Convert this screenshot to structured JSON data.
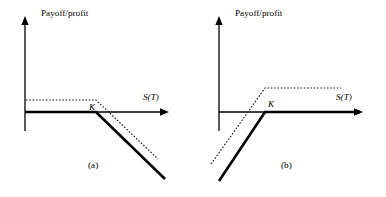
{
  "figure": {
    "width": 386,
    "height": 197,
    "background": "#ffffff",
    "line_color": "#000000"
  },
  "panels": [
    {
      "id": "a",
      "caption": "(a)",
      "caption_pos": {
        "x": 88,
        "y": 168
      },
      "y_axis_label": "Payoff/profit",
      "y_axis_label_pos": {
        "x": 41,
        "y": 16
      },
      "x_axis_label": "S(T)",
      "x_axis_label_pos": {
        "x": 143,
        "y": 100
      },
      "strike_label": "K",
      "strike_label_pos": {
        "x": 89,
        "y": 110
      },
      "axes": {
        "origin": {
          "x": 25,
          "y": 112
        },
        "y_top": 18,
        "y_bottom": 131,
        "x_right": 168
      },
      "strike_x": 96,
      "premium_y": 100
    },
    {
      "id": "b",
      "caption": "(b)",
      "caption_pos": {
        "x": 281,
        "y": 168
      },
      "y_axis_label": "Payoff/profit",
      "y_axis_label_pos": {
        "x": 235,
        "y": 16
      },
      "x_axis_label": "S(T)",
      "x_axis_label_pos": {
        "x": 336,
        "y": 100
      },
      "strike_label": "K",
      "strike_label_pos": {
        "x": 268,
        "y": 107
      },
      "axes": {
        "origin": {
          "x": 219,
          "y": 112
        },
        "y_top": 18,
        "y_bottom": 131,
        "x_right": 362
      },
      "strike_x": 265,
      "premium_y": 88
    }
  ],
  "chart_data": {
    "type": "line",
    "title": "",
    "subtitle": "",
    "xlabel": "S(T)",
    "ylabel": "Payoff/profit",
    "grid": false,
    "legend": "none",
    "annotations": [
      "K",
      "(a)",
      "(b)"
    ],
    "charts": [
      {
        "panel": "a",
        "description": "Short call position: payoff (solid) and profit (dotted) versus terminal stock price",
        "xlabel": "S(T)",
        "ylabel": "Payoff/profit",
        "x_axis_at_y": 0,
        "strike": "K",
        "series": [
          {
            "name": "payoff",
            "style": "solid",
            "points": [
              {
                "x": 25,
                "y": 112
              },
              {
                "x": 96,
                "y": 112
              },
              {
                "x": 165,
                "y": 179
              }
            ]
          },
          {
            "name": "profit",
            "style": "dotted",
            "points": [
              {
                "x": 26,
                "y": 100
              },
              {
                "x": 96,
                "y": 100
              },
              {
                "x": 158,
                "y": 159
              }
            ]
          }
        ]
      },
      {
        "panel": "b",
        "description": "Long call position: payoff (solid) and profit (dotted) versus terminal stock price",
        "xlabel": "S(T)",
        "ylabel": "Payoff/profit",
        "x_axis_at_y": 0,
        "strike": "K",
        "series": [
          {
            "name": "payoff",
            "style": "solid",
            "points": [
              {
                "x": 219,
                "y": 181
              },
              {
                "x": 265,
                "y": 112
              },
              {
                "x": 360,
                "y": 112
              }
            ]
          },
          {
            "name": "profit",
            "style": "dotted",
            "points": [
              {
                "x": 211,
                "y": 164
              },
              {
                "x": 265,
                "y": 88
              },
              {
                "x": 341,
                "y": 88
              }
            ]
          }
        ]
      }
    ]
  }
}
